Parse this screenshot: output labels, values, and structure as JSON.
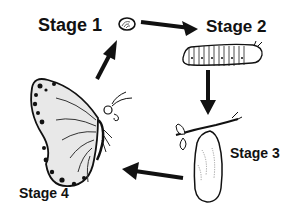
{
  "stages": [
    {
      "label": "Stage 1",
      "depicts": "egg"
    },
    {
      "label": "Stage 2",
      "depicts": "caterpillar"
    },
    {
      "label": "Stage 3",
      "depicts": "chrysalis"
    },
    {
      "label": "Stage 4",
      "depicts": "butterfly"
    }
  ],
  "arrows": [
    {
      "from": "Stage 1",
      "to": "Stage 2"
    },
    {
      "from": "Stage 2",
      "to": "Stage 3"
    },
    {
      "from": "Stage 3",
      "to": "Stage 4"
    },
    {
      "from": "Stage 4",
      "to": "Stage 1"
    }
  ],
  "colors": {
    "ink": "#111111",
    "background": "#ffffff",
    "shade": "#9a9a9a"
  }
}
